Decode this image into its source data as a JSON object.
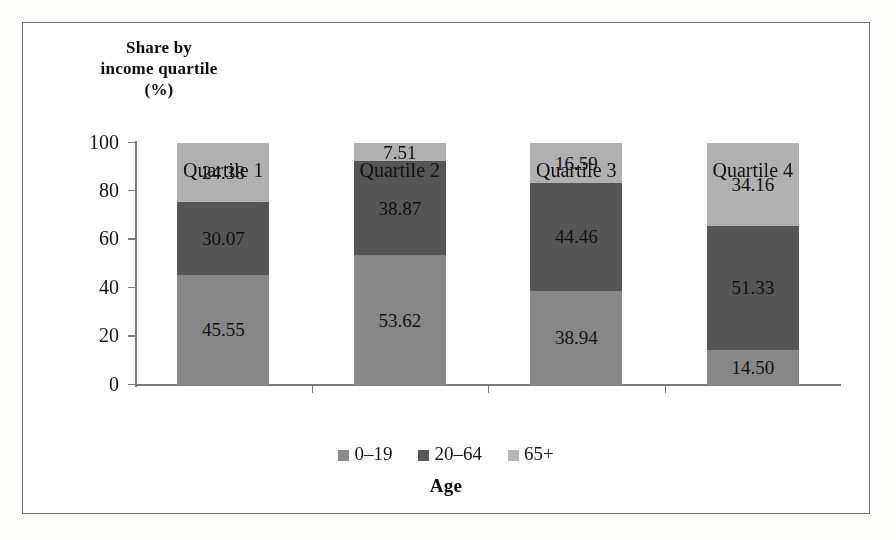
{
  "chart_data": {
    "type": "bar",
    "subtype": "stacked-100",
    "title": "",
    "ylabel": "Share by income quartile (%)",
    "ylabel_lines": [
      "Share by",
      "income quartile",
      "(%)"
    ],
    "xlabel": "Age",
    "categories": [
      "Quartile 1",
      "Quartile 2",
      "Quartile 3",
      "Quartile 4"
    ],
    "series": [
      {
        "name": "0–19",
        "color": "#8b8b8b",
        "values": [
          45.55,
          53.62,
          38.94,
          14.5
        ]
      },
      {
        "name": "20–64",
        "color": "#585858",
        "values": [
          30.07,
          38.87,
          44.46,
          51.33
        ]
      },
      {
        "name": "65+",
        "color": "#b6b6b6",
        "values": [
          24.38,
          7.51,
          16.59,
          34.16
        ]
      }
    ],
    "ylim": [
      0,
      100
    ],
    "yticks": [
      0,
      20,
      40,
      60,
      80,
      100
    ],
    "ytick_labels": [
      "0",
      "20",
      "40",
      "60",
      "80",
      "100"
    ],
    "grid": false,
    "legend_position": "bottom",
    "legend_entries": [
      "0–19",
      "20–64",
      "65+"
    ],
    "bar_labels_shown": true,
    "bar_label_format": "2-decimal"
  }
}
